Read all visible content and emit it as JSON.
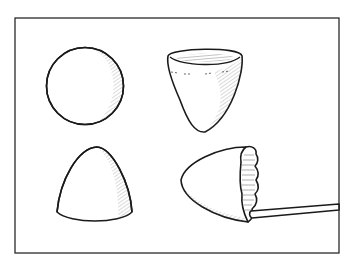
{
  "figure": {
    "title": "",
    "frame": {
      "x": 15,
      "y": 18,
      "width": 324,
      "height": 235,
      "stroke": "#2a2a2a"
    },
    "colors": {
      "ink": "#1a1a1a",
      "hatch": "#6a6a6a",
      "background": "#ffffff"
    },
    "shapes": [
      {
        "id": "sphere",
        "label": "sphere",
        "position": "top-left"
      },
      {
        "id": "cup",
        "label": "open cup / hollow paraboloid",
        "position": "top-right"
      },
      {
        "id": "dome",
        "label": "solid dome / cone-like bell",
        "position": "bottom-left"
      },
      {
        "id": "bullet-on-stick",
        "label": "paraboloid shell with ruffled edge on stick",
        "position": "bottom-right"
      }
    ]
  }
}
